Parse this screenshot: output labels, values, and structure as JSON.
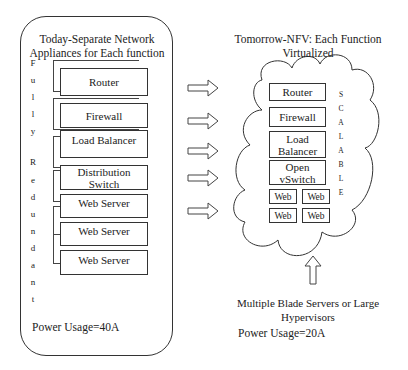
{
  "left_panel": {
    "title_line1": "Today-Separate Network",
    "title_line2": "Appliances for Each function",
    "vertical_label": [
      "F",
      "u",
      "l",
      "l",
      "y",
      "",
      "R",
      "e",
      "d",
      "u",
      "n",
      "d",
      "a",
      "n",
      "t"
    ],
    "boxes": [
      {
        "label": "Router"
      },
      {
        "label": "Firewall"
      },
      {
        "label": "Load Balancer"
      },
      {
        "label": "Distribution Switch"
      },
      {
        "label": "Web Server"
      },
      {
        "label": "Web Server"
      },
      {
        "label": "Web Server"
      }
    ],
    "power_usage": "Power Usage=40A"
  },
  "arrows": {
    "count": 5,
    "direction": "right"
  },
  "right_panel": {
    "title_line1": "Tomorrow-NFV: Each Function",
    "title_line2": "Virtualized",
    "cloud_boxes": {
      "router": "Router",
      "firewall": "Firewall",
      "load_balancer_1": "Load",
      "load_balancer_2": "Balancer",
      "vswitch_1": "Open",
      "vswitch_2": "vSwitch",
      "web": [
        "Web",
        "Web",
        "Web",
        "Web"
      ]
    },
    "vertical_label": [
      "S",
      "C",
      "A",
      "L",
      "A",
      "B",
      "L",
      "E"
    ],
    "bottom_label_line1": "Multiple Blade Servers or Large",
    "bottom_label_line2": "Hypervisors",
    "power_usage": "Power Usage=20A"
  }
}
